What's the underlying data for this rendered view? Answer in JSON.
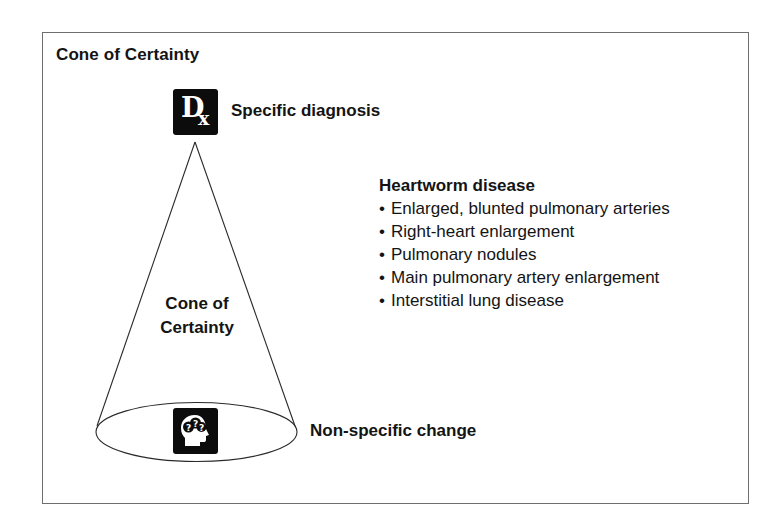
{
  "figure": {
    "title": "Cone of Certainty"
  },
  "cone": {
    "label_line1": "Cone of",
    "label_line2": "Certainty",
    "apex": {
      "icon": "dx-icon",
      "icon_text_main": "D",
      "icon_text_sub": "x",
      "label": "Specific diagnosis"
    },
    "base": {
      "icon": "head-question-marks-icon",
      "label": "Non-specific change"
    }
  },
  "findings": {
    "heading": "Heartworm disease",
    "bullet": "•",
    "items": [
      "Enlarged, blunted pulmonary arteries",
      "Right-heart enlargement",
      "Pulmonary nodules",
      "Main pulmonary artery enlargement",
      "Interstitial lung disease"
    ]
  },
  "colors": {
    "ink": "#141414",
    "frame": "#6e6e6e",
    "icon_bg": "#0c0c0c",
    "background": "#ffffff"
  }
}
